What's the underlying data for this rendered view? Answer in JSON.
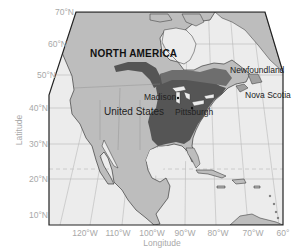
{
  "map": {
    "title": "NORTH AMERICA",
    "axes": {
      "xlabel": "Longitude",
      "ylabel": "Latitude",
      "lat_ticks": [
        "70°N",
        "60°N",
        "50°N",
        "40°N",
        "30°N",
        "20°N",
        "10°N"
      ],
      "lon_ticks": [
        "120°W",
        "110°W",
        "100°W",
        "90°W",
        "80°W",
        "70°W",
        "60°"
      ]
    },
    "labels": {
      "newfoundland": "Newfoundland",
      "nova_scotia": "Nova Scotia",
      "madison": "Madison",
      "pittsburgh": "Pittsburgh",
      "united_states": "United States"
    },
    "colors": {
      "ocean": "#ececec",
      "land": "#bdbdbd",
      "highlight_land": "#9a9a9a",
      "range_dark": "#555555",
      "range_mid": "#6e6e6e",
      "graticule": "#b5b5b5",
      "tropic_dashed": "#c8c8c8",
      "frame": "#222222"
    }
  }
}
